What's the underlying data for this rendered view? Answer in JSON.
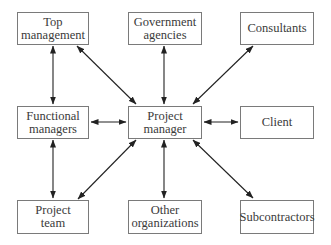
{
  "diagram": {
    "type": "stakeholder-hub",
    "center": "project-manager",
    "nodes": [
      {
        "id": "top-management",
        "lines": [
          "Top",
          "management"
        ],
        "x": 17,
        "y": 12,
        "w": 72,
        "h": 33
      },
      {
        "id": "government-agencies",
        "lines": [
          "Government",
          "agencies"
        ],
        "x": 128,
        "y": 12,
        "w": 74,
        "h": 33
      },
      {
        "id": "consultants",
        "lines": [
          "Consultants"
        ],
        "x": 240,
        "y": 12,
        "w": 74,
        "h": 33
      },
      {
        "id": "functional-managers",
        "lines": [
          "Functional",
          "managers"
        ],
        "x": 17,
        "y": 106,
        "w": 72,
        "h": 33
      },
      {
        "id": "project-manager",
        "lines": [
          "Project",
          "manager"
        ],
        "x": 128,
        "y": 106,
        "w": 74,
        "h": 33
      },
      {
        "id": "client",
        "lines": [
          "Client"
        ],
        "x": 240,
        "y": 106,
        "w": 74,
        "h": 33
      },
      {
        "id": "project-team",
        "lines": [
          "Project",
          "team"
        ],
        "x": 17,
        "y": 200,
        "w": 72,
        "h": 34
      },
      {
        "id": "other-organizations",
        "lines": [
          "Other",
          "organizations"
        ],
        "x": 128,
        "y": 200,
        "w": 74,
        "h": 34
      },
      {
        "id": "subcontractors",
        "lines": [
          "Subcontractors"
        ],
        "x": 240,
        "y": 200,
        "w": 74,
        "h": 34
      }
    ],
    "edges": [
      {
        "from": "project-manager",
        "to": "top-management",
        "bidirectional": true
      },
      {
        "from": "project-manager",
        "to": "government-agencies",
        "bidirectional": true
      },
      {
        "from": "project-manager",
        "to": "consultants",
        "bidirectional": true
      },
      {
        "from": "project-manager",
        "to": "functional-managers",
        "bidirectional": true
      },
      {
        "from": "project-manager",
        "to": "client",
        "bidirectional": true
      },
      {
        "from": "project-manager",
        "to": "project-team",
        "bidirectional": true
      },
      {
        "from": "project-manager",
        "to": "other-organizations",
        "bidirectional": true
      },
      {
        "from": "project-manager",
        "to": "subcontractors",
        "bidirectional": true
      },
      {
        "from": "top-management",
        "to": "functional-managers",
        "bidirectional": true
      },
      {
        "from": "functional-managers",
        "to": "project-team",
        "bidirectional": true
      }
    ]
  }
}
